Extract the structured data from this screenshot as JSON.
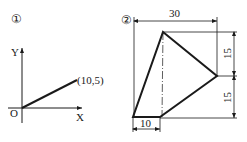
{
  "figure1": {
    "marker": "①",
    "origin_label": "O",
    "x_axis_label": "X",
    "y_axis_label": "Y",
    "point_label": "(10,5)",
    "point": [
      10,
      5
    ]
  },
  "figure2": {
    "marker": "②",
    "dimensions": {
      "top_width": "30",
      "right_upper_height": "15",
      "right_lower_height": "15",
      "bottom_width": "10"
    }
  },
  "colors": {
    "line": "#1a1a1a",
    "background": "#ffffff"
  }
}
